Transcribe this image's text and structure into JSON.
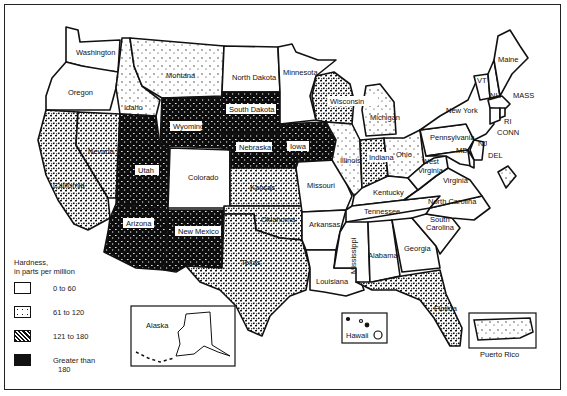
{
  "legend": {
    "title_line1": "Hardness,",
    "title_line2": "in parts per million",
    "items": [
      {
        "label": "0 to 60",
        "class": "c0",
        "fill": "#ffffff"
      },
      {
        "label": "61 to 120",
        "class": "c1",
        "fill": "#f0f0f0"
      },
      {
        "label": "121 to 180",
        "class": "c2",
        "fill": "#777777"
      },
      {
        "label": "Greater than",
        "label2": "180",
        "class": "c3",
        "fill": "#111111"
      }
    ]
  },
  "states": {
    "washington": "Washington",
    "oregon": "Oregon",
    "california": "California",
    "nevada": "Nevada",
    "idaho": "Idaho",
    "montana": "Montana",
    "wyoming": "Wyoming",
    "utah": "Utah",
    "arizona": "Arizona",
    "colorado": "Colorado",
    "new_mexico": "New Mexico",
    "north_dakota": "North Dakota",
    "south_dakota": "South Dakota",
    "nebraska": "Nebraska",
    "kansas": "Kansas",
    "oklahoma": "Oklahoma",
    "texas": "Texas",
    "minnesota": "Minnesota",
    "iowa": "Iowa",
    "missouri": "Missouri",
    "arkansas": "Arkansas",
    "louisiana": "Louisiana",
    "wisconsin": "Wisconsin",
    "illinois": "Illinois",
    "michigan": "Michigan",
    "indiana": "Indiana",
    "ohio": "Ohio",
    "kentucky": "Kentucky",
    "tennessee": "Tennessee",
    "mississippi": "Mississippi",
    "alabama": "Alabama",
    "georgia": "Georgia",
    "florida": "Florida",
    "south_carolina_1": "South",
    "south_carolina_2": "Carolina",
    "north_carolina": "North Carolina",
    "virginia": "Virginia",
    "west_virginia_1": "West",
    "west_virginia_2": "Virginia",
    "pennsylvania": "Pennsylvania",
    "new_york": "New York",
    "maine": "Maine",
    "vermont": "VT",
    "new_hampshire": "NH",
    "massachusetts": "MASS",
    "rhode_island": "RI",
    "connecticut": "CONN",
    "new_jersey": "NJ",
    "delaware": "DEL",
    "maryland": "MD",
    "alaska": "Alaska",
    "hawaii": "Hawaii",
    "puerto_rico": "Puerto Rico"
  }
}
